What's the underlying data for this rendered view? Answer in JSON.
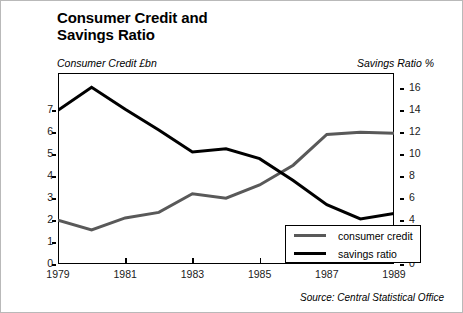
{
  "title": "Consumer Credit and\nSavings Ratio",
  "title_line1": "Consumer Credit and",
  "title_line2": "Savings Ratio",
  "left_axis_caption": "Consumer Credit £bn",
  "right_axis_caption": "Savings Ratio %",
  "source": "Source: Central Statistical Office",
  "legend": {
    "items": [
      {
        "label": "consumer credit",
        "color": "#595959"
      },
      {
        "label": "savings ratio",
        "color": "#000000"
      }
    ]
  },
  "chart_data": {
    "type": "line",
    "title": "Consumer Credit and Savings Ratio",
    "xlabel": "",
    "ylabel": "Consumer Credit £bn",
    "y2label": "Savings Ratio %",
    "x": [
      1979,
      1980,
      1981,
      1982,
      1983,
      1984,
      1985,
      1986,
      1987,
      1988,
      1989
    ],
    "xticklabels": [
      "1979",
      "1981",
      "1983",
      "1985",
      "1987",
      "1989"
    ],
    "xtickvalues": [
      1979,
      1981,
      1983,
      1985,
      1987,
      1989
    ],
    "xlim": [
      1979,
      1989
    ],
    "ylim": [
      0,
      8.7
    ],
    "yticks": [
      0,
      1,
      2,
      3,
      4,
      5,
      6,
      7
    ],
    "yticklabels": [
      "0",
      "1",
      "2",
      "3",
      "4",
      "5",
      "6",
      "7"
    ],
    "y2lim": [
      0,
      17.4
    ],
    "y2ticks": [
      0,
      2,
      4,
      6,
      8,
      10,
      12,
      14,
      16
    ],
    "y2ticklabels": [
      "0",
      "2",
      "4",
      "6",
      "8",
      "10",
      "12",
      "14",
      "16"
    ],
    "grid": false,
    "legend_position": "lower right",
    "series": [
      {
        "name": "consumer credit",
        "axis": "left",
        "units": "£bn",
        "color": "#595959",
        "values": [
          2.0,
          1.55,
          2.1,
          2.35,
          3.2,
          3.0,
          3.6,
          4.5,
          5.9,
          6.0,
          5.95
        ]
      },
      {
        "name": "savings ratio",
        "axis": "right",
        "units": "%",
        "color": "#000000",
        "values": [
          14.0,
          16.1,
          14.1,
          12.2,
          10.2,
          10.5,
          9.6,
          7.6,
          5.4,
          4.1,
          4.6
        ]
      }
    ]
  }
}
